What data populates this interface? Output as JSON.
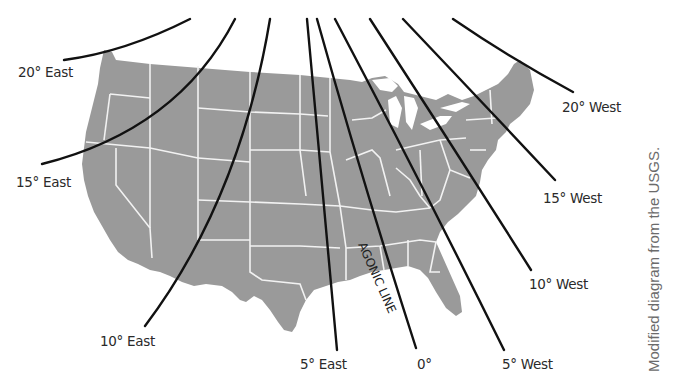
{
  "diagram": {
    "map": {
      "fill_color": "#9a9a9a",
      "border_color": "#f2f2f2",
      "line_color": "#111111"
    },
    "isogonic_lines": [
      {
        "id": "20-east",
        "label": "20° East"
      },
      {
        "id": "15-east",
        "label": "15° East"
      },
      {
        "id": "10-east",
        "label": "10° East"
      },
      {
        "id": "5-east",
        "label": "5° East"
      },
      {
        "id": "0",
        "label": "0°"
      },
      {
        "id": "5-west",
        "label": "5° West"
      },
      {
        "id": "10-west",
        "label": "10° West"
      },
      {
        "id": "15-west",
        "label": "15° West"
      },
      {
        "id": "20-west",
        "label": "20° West"
      }
    ],
    "agonic_label": "AGONIC LINE",
    "credit": "Modified diagram from the USGS."
  }
}
